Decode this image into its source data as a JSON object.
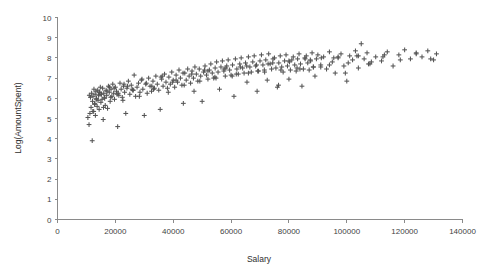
{
  "chart_data": {
    "type": "scatter",
    "title": "",
    "xlabel": "Salary",
    "ylabel": "Log(AmountSpent)",
    "xlim": [
      0,
      140000
    ],
    "ylim": [
      0,
      10
    ],
    "xticks": [
      0,
      20000,
      40000,
      60000,
      80000,
      100000,
      120000,
      140000
    ],
    "xticklabels": [
      "0",
      "20000",
      "40000",
      "60000",
      "80000",
      "100000",
      "120000",
      "140000"
    ],
    "yticks": [
      0,
      1,
      2,
      3,
      4,
      5,
      6,
      7,
      8,
      9,
      10
    ],
    "yticklabels": [
      "0",
      "1",
      "2",
      "3",
      "4",
      "5",
      "6",
      "7",
      "8",
      "9",
      "10"
    ],
    "grid": false,
    "legend": false,
    "marker": "plus",
    "marker_color": "#555555",
    "series": [
      {
        "name": "Customers",
        "x": [
          10500,
          10900,
          11200,
          11400,
          11600,
          11800,
          12000,
          12100,
          12300,
          12500,
          12600,
          12800,
          13000,
          13100,
          13300,
          13500,
          13700,
          13900,
          14000,
          14200,
          14400,
          14600,
          14800,
          15000,
          15200,
          15400,
          15600,
          15800,
          16000,
          16200,
          16500,
          16800,
          17000,
          17300,
          17600,
          17900,
          18200,
          18500,
          18800,
          19100,
          19400,
          19700,
          20000,
          20400,
          20800,
          21200,
          21600,
          22000,
          22400,
          22800,
          23200,
          23600,
          24000,
          24500,
          25000,
          25500,
          26000,
          26500,
          27000,
          27500,
          28000,
          28500,
          29000,
          29500,
          30000,
          30500,
          31000,
          31500,
          32000,
          32500,
          33000,
          33500,
          34000,
          34500,
          35000,
          35500,
          36000,
          36500,
          37000,
          37500,
          38000,
          38500,
          39000,
          39500,
          40000,
          40500,
          41000,
          41500,
          42000,
          42500,
          43000,
          43500,
          44000,
          44500,
          45000,
          45500,
          46000,
          46500,
          47000,
          47500,
          48000,
          48500,
          49000,
          49500,
          50000,
          50500,
          51000,
          51500,
          52000,
          52500,
          53000,
          53500,
          54000,
          54500,
          55000,
          55500,
          56000,
          56500,
          57000,
          57500,
          58000,
          58500,
          59000,
          59500,
          60000,
          60500,
          61000,
          61500,
          62000,
          62500,
          63000,
          63500,
          64000,
          64500,
          65000,
          65500,
          66000,
          66500,
          67000,
          67500,
          68000,
          68500,
          69000,
          69500,
          70000,
          70500,
          71000,
          71500,
          72000,
          72500,
          73000,
          73500,
          74000,
          74500,
          75000,
          75500,
          76000,
          76500,
          77000,
          77500,
          78000,
          78500,
          79000,
          79500,
          80000,
          80500,
          81000,
          81500,
          82000,
          82500,
          83000,
          83500,
          84000,
          84500,
          85000,
          85500,
          86000,
          86500,
          87000,
          87500,
          88000,
          88500,
          89000,
          89500,
          90000,
          91000,
          92000,
          93000,
          94000,
          95000,
          96000,
          97000,
          98000,
          99000,
          100000,
          101000,
          102000,
          103000,
          104000,
          105000,
          106000,
          107000,
          108000,
          110000,
          112000,
          114000,
          116000,
          118000,
          120000,
          122000,
          124000,
          126000,
          128000,
          130000,
          131000,
          12200,
          13400,
          14700,
          15900,
          17100,
          18400,
          19600,
          21000,
          22600,
          24200,
          26200,
          28300,
          30700,
          33200,
          35800,
          38300,
          41000,
          43800,
          46400,
          49200,
          52000,
          54800,
          57600,
          60400,
          63200,
          66000,
          68800,
          71600,
          74400,
          77200,
          80000,
          82800,
          85600,
          88400,
          91200,
          94000,
          97000,
          100500,
          104000,
          108500,
          113000,
          118500,
          124000,
          129000,
          11000,
          12900,
          14500,
          16300,
          18000,
          20600,
          23000,
          25800,
          29200,
          32600,
          36200,
          39800,
          43400,
          47200,
          50800,
          54400,
          58200,
          61800,
          65400,
          69200,
          72800,
          76400,
          80200,
          83800,
          87400,
          91000,
          95500,
          99500,
          103500,
          107500,
          112500
        ],
        "y": [
          5.05,
          4.7,
          5.25,
          6.05,
          5.55,
          6.25,
          3.9,
          5.85,
          6.1,
          5.35,
          6.45,
          5.7,
          6.2,
          5.15,
          6.35,
          6.0,
          5.6,
          6.4,
          5.9,
          6.15,
          5.45,
          6.3,
          6.55,
          5.8,
          6.2,
          5.95,
          6.5,
          4.95,
          6.25,
          6.05,
          5.65,
          6.4,
          6.15,
          5.5,
          6.6,
          6.3,
          5.85,
          6.45,
          6.1,
          6.7,
          6.25,
          5.95,
          6.55,
          6.35,
          4.6,
          6.15,
          6.75,
          6.45,
          6.05,
          6.6,
          6.3,
          5.25,
          6.5,
          6.85,
          6.2,
          6.65,
          6.4,
          7.15,
          6.1,
          6.55,
          6.75,
          6.3,
          6.9,
          6.45,
          5.15,
          6.7,
          6.25,
          7.0,
          6.6,
          6.35,
          6.85,
          6.5,
          7.1,
          6.7,
          6.4,
          5.45,
          6.95,
          6.6,
          7.2,
          6.8,
          6.5,
          7.05,
          6.7,
          7.3,
          6.9,
          6.55,
          7.15,
          6.8,
          7.4,
          7.0,
          6.65,
          5.75,
          7.25,
          6.9,
          7.45,
          7.1,
          6.75,
          7.35,
          7.0,
          7.55,
          7.2,
          6.85,
          7.45,
          7.1,
          5.85,
          7.3,
          7.6,
          7.15,
          6.95,
          7.4,
          7.7,
          7.25,
          7.0,
          7.5,
          7.8,
          7.3,
          6.45,
          7.55,
          7.85,
          7.35,
          7.1,
          7.6,
          7.9,
          7.4,
          7.15,
          7.65,
          6.1,
          7.95,
          7.45,
          7.2,
          7.7,
          8.0,
          7.5,
          7.25,
          7.75,
          6.8,
          8.05,
          7.55,
          7.3,
          7.8,
          8.1,
          7.6,
          6.35,
          7.35,
          7.85,
          8.15,
          7.65,
          7.4,
          7.9,
          6.9,
          8.2,
          7.7,
          7.45,
          7.95,
          8.0,
          7.5,
          6.55,
          7.75,
          8.1,
          7.55,
          7.3,
          7.85,
          8.15,
          7.6,
          6.95,
          7.4,
          7.9,
          8.05,
          7.65,
          7.35,
          7.95,
          8.2,
          7.7,
          6.6,
          7.45,
          8.0,
          8.1,
          7.75,
          7.4,
          7.85,
          8.25,
          7.55,
          7.1,
          7.95,
          8.15,
          7.65,
          8.05,
          7.45,
          8.3,
          7.8,
          7.25,
          8.0,
          8.2,
          7.6,
          6.85,
          8.1,
          7.9,
          8.35,
          7.5,
          8.7,
          7.95,
          8.25,
          7.7,
          8.05,
          7.85,
          8.3,
          7.6,
          8.15,
          8.4,
          7.95,
          8.25,
          8.05,
          8.35,
          7.9,
          8.2,
          5.35,
          5.95,
          6.2,
          5.55,
          6.35,
          6.05,
          6.5,
          6.25,
          5.9,
          6.6,
          6.4,
          6.1,
          6.75,
          6.45,
          7.05,
          6.3,
          6.9,
          6.65,
          7.2,
          6.85,
          7.35,
          7.0,
          7.45,
          7.1,
          7.55,
          7.25,
          7.65,
          7.3,
          7.75,
          7.4,
          7.85,
          7.5,
          7.95,
          7.55,
          8.0,
          7.65,
          8.05,
          7.75,
          8.1,
          7.8,
          8.15,
          7.9,
          8.2,
          7.95,
          6.15,
          5.75,
          6.3,
          6.0,
          6.55,
          6.2,
          6.7,
          6.45,
          6.95,
          6.6,
          7.1,
          6.8,
          7.25,
          6.35,
          7.4,
          7.05,
          7.5,
          7.2,
          7.6,
          7.35,
          7.7,
          6.65,
          7.8,
          7.45,
          7.9,
          7.55,
          8.0,
          7.25,
          8.1,
          7.7,
          8.05
        ]
      }
    ]
  },
  "axes": {
    "y_title": "Log(AmountSpent)",
    "x_title": "Salary"
  }
}
